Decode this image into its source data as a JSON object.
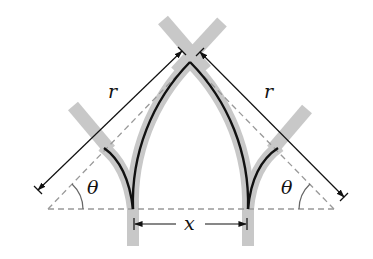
{
  "diagram": {
    "type": "geometric-figure",
    "labels": {
      "radius_left": "r",
      "radius_right": "r",
      "angle_left": "θ",
      "angle_right": "θ",
      "span": "x"
    },
    "colors": {
      "stroke": "#111111",
      "band": "#c8c8c8",
      "dashed": "#999999",
      "background": "#ffffff"
    }
  }
}
